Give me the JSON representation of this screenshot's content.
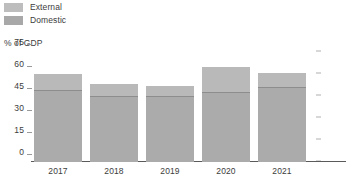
{
  "chart_data": {
    "type": "bar",
    "title": "",
    "subtitle": "",
    "xlabel": "",
    "ylabel": "% of GDP",
    "stacked": true,
    "orientation": "vertical",
    "grid": false,
    "legend_position": "top-left",
    "categories": [
      "2017",
      "2018",
      "2019",
      "2020",
      "2021"
    ],
    "ylim": [
      0,
      75
    ],
    "yticks": [
      75,
      60,
      45,
      30,
      15,
      0
    ],
    "ytick_labels": [
      "75",
      "60",
      "45",
      "30",
      "15",
      "0"
    ],
    "series": [
      {
        "name": "Domestic",
        "color": "#ababab",
        "values": [
          49,
          45,
          45,
          48,
          51
        ]
      },
      {
        "name": "External",
        "color": "#b9b9b9",
        "values": [
          11,
          8,
          7,
          17,
          10
        ]
      }
    ],
    "totals": [
      60,
      53,
      52,
      65,
      61
    ]
  },
  "legend": {
    "items": [
      {
        "label": "External",
        "color": "#bdbdbd"
      },
      {
        "label": "Domestic",
        "color": "#a8a8a8"
      }
    ]
  },
  "axis": {
    "y_title": "% of GDP"
  },
  "style": {
    "background": "#ffffff",
    "text_color": "#3c3c3c",
    "axis_line": "#5a5a5a",
    "tick_color": "#9a9a9a",
    "divider_color": "#8d8d8d"
  }
}
